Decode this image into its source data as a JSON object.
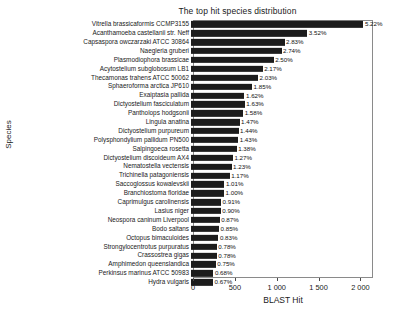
{
  "chart_data": {
    "type": "bar",
    "orientation": "horizontal",
    "title": "The top hit species distribution",
    "xlabel": "BLAST Hit",
    "ylabel": "Species",
    "xlim": [
      0,
      2150
    ],
    "xticks": [
      0,
      500,
      1000,
      1500,
      2000
    ],
    "xticklabels": [
      "0",
      "500",
      "1 000",
      "1 500",
      "2 000"
    ],
    "grid": false,
    "legend": null,
    "bar_color": "#1c1c1c",
    "categories": [
      "Vitrella brassicaformis CCMP3155",
      "Acanthamoeba castellanii str. Neff",
      "Capsaspora owczarzaki ATCC 30864",
      "Naegleria gruberi",
      "Plasmodiophora brassicae",
      "Acytostelium subglobosum LB1",
      "Thecamonas trahens ATCC 50062",
      "Sphaeroforma arctica JP610",
      "Exaiptasia pallida",
      "Dictyostelium fasciculatum",
      "Pantholops hodgsonii",
      "Lingula anatina",
      "Dictyostelium purpureum",
      "Polysphondylium pallidum PN500",
      "Salpingoeca rosetta",
      "Dictyostelium discoideum AX4",
      "Nematostella vectensis",
      "Trichinella patagoniensis",
      "Saccoglossus kowalevskii",
      "Branchiostoma floridae",
      "Caprimulgus carolinensis",
      "Lasius niger",
      "Neospora caninum Liverpool",
      "Bodo saltans",
      "Octopus bimaculoides",
      "Strongylocentrotus purpuratus",
      "Crassostrea gigas",
      "Amphimedon queenslandica",
      "Perkinsus marinus ATCC 50983",
      "Hydra vulgaris"
    ],
    "values": [
      2060,
      1390,
      1117,
      1081,
      987,
      856,
      801,
      730,
      639,
      643,
      623,
      580,
      568,
      564,
      545,
      501,
      485,
      462,
      399,
      395,
      359,
      355,
      343,
      335,
      327,
      308,
      308,
      296,
      268,
      264
    ],
    "datalabels": [
      "5.22%",
      "3.52%",
      "2.83%",
      "2.74%",
      "2.50%",
      "2.17%",
      "2.03%",
      "1.85%",
      "1.62%",
      "1.63%",
      "1.58%",
      "1.47%",
      "1.44%",
      "1.43%",
      "1.38%",
      "1.27%",
      "1.23%",
      "1.17%",
      "1.01%",
      "1.00%",
      "0.91%",
      "0.90%",
      "0.87%",
      "0.85%",
      "0.83%",
      "0.78%",
      "0.78%",
      "0.75%",
      "0.68%",
      "0.67%"
    ]
  }
}
